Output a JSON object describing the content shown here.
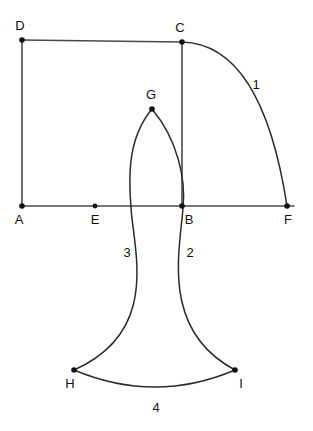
{
  "figure": {
    "background_color": "#ffffff",
    "line_color": "#4a4a4a",
    "arc_color": "#2b2b2b",
    "dot_color": "#111111",
    "label_color": "#111111"
  },
  "points": [
    {
      "id": "A",
      "label": "A",
      "x": 22,
      "y": 206,
      "label_x": 19,
      "label_y": 224
    },
    {
      "id": "B",
      "label": "B",
      "x": 182,
      "y": 206,
      "label_x": 187,
      "label_y": 224
    },
    {
      "id": "C",
      "label": "C",
      "x": 182,
      "y": 42,
      "label_x": 178,
      "label_y": 31
    },
    {
      "id": "D",
      "label": "D",
      "x": 22,
      "y": 40,
      "label_x": 18,
      "label_y": 29
    },
    {
      "id": "E",
      "label": "E",
      "x": 95,
      "y": 206,
      "label_x": 91,
      "label_y": 224
    },
    {
      "id": "F",
      "label": "F",
      "x": 287,
      "y": 206,
      "label_x": 283,
      "label_y": 224
    },
    {
      "id": "G",
      "label": "G",
      "x": 152,
      "y": 109,
      "label_x": 147,
      "label_y": 98
    },
    {
      "id": "H",
      "label": "H",
      "x": 74,
      "y": 370,
      "label_x": 67,
      "label_y": 388
    },
    {
      "id": "I",
      "label": "I",
      "x": 235,
      "y": 370,
      "label_x": 241,
      "label_y": 388
    }
  ],
  "segments": [
    {
      "id": "AD",
      "from": "A",
      "to": "D",
      "x1": 22,
      "y1": 206,
      "x2": 22,
      "y2": 40
    },
    {
      "id": "DC",
      "from": "D",
      "to": "C",
      "x1": 22,
      "y1": 40,
      "x2": 182,
      "y2": 42
    },
    {
      "id": "CB",
      "from": "C",
      "to": "B",
      "x1": 182,
      "y1": 42,
      "x2": 182,
      "y2": 206
    },
    {
      "id": "AF",
      "from": "A",
      "to": "F",
      "x1": 22,
      "y1": 206,
      "x2": 294,
      "y2": 206
    }
  ],
  "arcs": [
    {
      "id": "arc1",
      "label": "1",
      "from": "C",
      "to": "F",
      "center": "B",
      "path": "M 182 42 Q 262 44 287 206",
      "label_x": 252,
      "label_y": 89
    },
    {
      "id": "arc2",
      "label": "2",
      "from": "G",
      "to": "I",
      "path": "M 152 109 C 178 140 186 180 183 208 C 180 250 160 330 235 370",
      "label_x": 186,
      "label_y": 257
    },
    {
      "id": "arc3",
      "label": "3",
      "from": "G",
      "to": "H",
      "path": "M 152 109 C 126 140 129 182 131 208 C 134 252 160 332 74 370",
      "label_x": 124,
      "label_y": 257
    },
    {
      "id": "arc4",
      "label": "4",
      "from": "H",
      "to": "I",
      "path": "M 74 370 Q 155 404 235 370",
      "label_x": 152,
      "label_y": 412
    }
  ]
}
